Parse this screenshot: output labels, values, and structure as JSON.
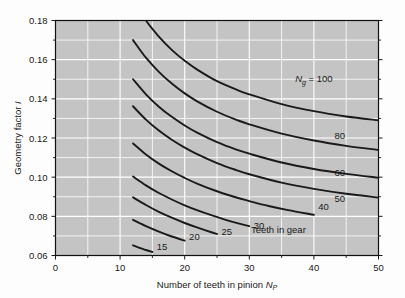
{
  "chart_data": {
    "type": "line",
    "title": "",
    "xlabel": "Number of teeth in pinion N_P",
    "xlabel_main": "Number of teeth in pinion ",
    "xlabel_sym": "N",
    "xlabel_sub": "P",
    "ylabel": "Geometry factor I",
    "ylabel_main": "Geometry factor ",
    "ylabel_sym": "I",
    "xlim": [
      0,
      50
    ],
    "ylim": [
      0.06,
      0.18
    ],
    "xticks": [
      0,
      10,
      20,
      30,
      40,
      50
    ],
    "xtick_labels": [
      "0",
      "10",
      "20",
      "30",
      "40",
      "50"
    ],
    "yticks": [
      0.06,
      0.08,
      0.1,
      0.12,
      0.14,
      0.16,
      0.18
    ],
    "ytick_labels": [
      "0.06",
      "0.08",
      "0.10",
      "0.12",
      "0.14",
      "0.16",
      "0.18"
    ],
    "x_minor_step": 5,
    "y_minor_step": 0.01,
    "grid": true,
    "grid_color": "#ffffff",
    "plot_bg": "#c4c4c4",
    "figure_bg": "#fdfdfd",
    "line_color": "#1a1a1a",
    "legend": "none",
    "annotations": [
      {
        "text": "Teeth in gear",
        "x": 34.5,
        "y": 0.0715
      }
    ],
    "series_label_prefix": "N",
    "series_label_sub": "g",
    "series_label_eq": " = 100",
    "series": [
      {
        "name": "100",
        "label": "N_g = 100",
        "label_x": 40.0,
        "label_y": 0.1485,
        "points": [
          [
            12,
            0.1905
          ],
          [
            14,
            0.18
          ],
          [
            16,
            0.1718
          ],
          [
            18,
            0.165
          ],
          [
            20,
            0.1594
          ],
          [
            22,
            0.1548
          ],
          [
            25,
            0.149
          ],
          [
            28,
            0.1447
          ],
          [
            30,
            0.1423
          ],
          [
            35,
            0.1373
          ],
          [
            40,
            0.1337
          ],
          [
            45,
            0.131
          ],
          [
            50,
            0.129
          ]
        ]
      },
      {
        "name": "80",
        "label": "80",
        "label_x": 44.0,
        "label_y": 0.1195,
        "points": [
          [
            12,
            0.17
          ],
          [
            14,
            0.161
          ],
          [
            16,
            0.1538
          ],
          [
            18,
            0.1478
          ],
          [
            20,
            0.1428
          ],
          [
            22,
            0.1386
          ],
          [
            25,
            0.1334
          ],
          [
            28,
            0.1293
          ],
          [
            30,
            0.127
          ],
          [
            35,
            0.1222
          ],
          [
            40,
            0.1187
          ],
          [
            45,
            0.116
          ],
          [
            50,
            0.1139
          ]
        ]
      },
      {
        "name": "60",
        "label": "60",
        "label_x": 44.0,
        "label_y": 0.1005,
        "points": [
          [
            12,
            0.15
          ],
          [
            14,
            0.1423
          ],
          [
            16,
            0.136
          ],
          [
            18,
            0.1308
          ],
          [
            20,
            0.1264
          ],
          [
            22,
            0.1226
          ],
          [
            25,
            0.1179
          ],
          [
            28,
            0.1141
          ],
          [
            30,
            0.112
          ],
          [
            35,
            0.1075
          ],
          [
            40,
            0.1042
          ],
          [
            45,
            0.1017
          ],
          [
            50,
            0.0997
          ]
        ]
      },
      {
        "name": "50",
        "label": "50",
        "label_x": 44.0,
        "label_y": 0.0875,
        "points": [
          [
            12,
            0.1362
          ],
          [
            14,
            0.1294
          ],
          [
            16,
            0.1238
          ],
          [
            18,
            0.1191
          ],
          [
            20,
            0.1151
          ],
          [
            22,
            0.1116
          ],
          [
            25,
            0.1072
          ],
          [
            28,
            0.1036
          ],
          [
            30,
            0.1015
          ],
          [
            35,
            0.0972
          ],
          [
            40,
            0.094
          ],
          [
            45,
            0.0915
          ],
          [
            50,
            0.0896
          ]
        ]
      },
      {
        "name": "40",
        "label": "40",
        "label_x": 41.5,
        "label_y": 0.0832,
        "points": [
          [
            12,
            0.1172
          ],
          [
            14,
            0.1116
          ],
          [
            16,
            0.1069
          ],
          [
            18,
            0.103
          ],
          [
            20,
            0.0996
          ],
          [
            22,
            0.0966
          ],
          [
            25,
            0.0928
          ],
          [
            28,
            0.0896
          ],
          [
            30,
            0.0878
          ],
          [
            33,
            0.0853
          ],
          [
            36,
            0.0832
          ],
          [
            40,
            0.0808
          ]
        ]
      },
      {
        "name": "30",
        "label": "30",
        "label_x": 31.5,
        "label_y": 0.0735,
        "points": [
          [
            12,
            0.1003
          ],
          [
            14,
            0.0958
          ],
          [
            16,
            0.0919
          ],
          [
            18,
            0.0886
          ],
          [
            20,
            0.0856
          ],
          [
            22,
            0.083
          ],
          [
            24,
            0.0807
          ],
          [
            26,
            0.0786
          ],
          [
            28,
            0.0767
          ],
          [
            30,
            0.075
          ]
        ]
      },
      {
        "name": "25",
        "label": "25",
        "label_x": 26.5,
        "label_y": 0.0705,
        "points": [
          [
            12,
            0.0897
          ],
          [
            14,
            0.0858
          ],
          [
            16,
            0.0823
          ],
          [
            18,
            0.0793
          ],
          [
            20,
            0.0766
          ],
          [
            22,
            0.0742
          ],
          [
            24,
            0.072
          ],
          [
            25,
            0.071
          ]
        ]
      },
      {
        "name": "20",
        "label": "20",
        "label_x": 21.5,
        "label_y": 0.0678,
        "points": [
          [
            12,
            0.0782
          ],
          [
            14,
            0.075
          ],
          [
            16,
            0.0722
          ],
          [
            18,
            0.0697
          ],
          [
            20,
            0.0676
          ]
        ]
      },
      {
        "name": "15",
        "label": "15",
        "label_x": 16.5,
        "label_y": 0.0627,
        "points": [
          [
            12,
            0.0652
          ],
          [
            13,
            0.0639
          ],
          [
            14,
            0.0628
          ],
          [
            15,
            0.0618
          ]
        ]
      }
    ]
  }
}
